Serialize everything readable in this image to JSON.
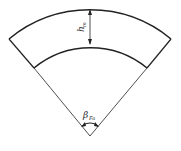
{
  "diagram": {
    "labels": {
      "height": "h",
      "height_sub": "m",
      "angle": "β",
      "angle_sub": "Fa"
    },
    "colors": {
      "stroke": "#222222",
      "background": "#ffffff"
    }
  }
}
